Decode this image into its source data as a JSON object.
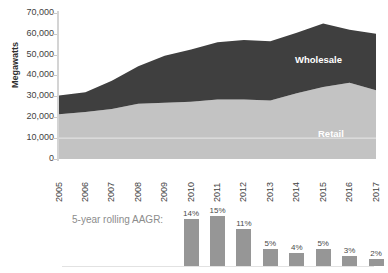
{
  "chart_data": {
    "type": "area",
    "title": "",
    "xlabel": "",
    "ylabel": "Megawatts",
    "ylim": [
      0,
      70000
    ],
    "ytick_labels": [
      "70,000",
      "60,000",
      "50,000",
      "40,000",
      "30,000",
      "20,000",
      "10,000",
      "0"
    ],
    "ytick_values": [
      70000,
      60000,
      50000,
      40000,
      30000,
      20000,
      10000,
      0
    ],
    "grid": false,
    "legend_position": "inline-annotation",
    "stacked": true,
    "categories": [
      "2005",
      "2006",
      "2007",
      "2008",
      "2009",
      "2010",
      "2011",
      "2012",
      "2013",
      "2014",
      "2015",
      "2016",
      "2017"
    ],
    "series": [
      {
        "name": "Retail",
        "color": "#c3c3c3",
        "values": [
          21500,
          22500,
          24000,
          26500,
          27000,
          27500,
          28500,
          28500,
          28000,
          31500,
          34500,
          36500,
          33000
        ]
      },
      {
        "name": "Wholesale",
        "color": "#3f3f3f",
        "values": [
          9000,
          9500,
          13500,
          18000,
          22500,
          25000,
          27500,
          28500,
          28500,
          29000,
          30500,
          25500,
          27000
        ]
      }
    ],
    "totals": [
      30500,
      32000,
      37500,
      44500,
      49500,
      52500,
      56000,
      57000,
      56500,
      60500,
      65000,
      62000,
      60000
    ],
    "annotations": [
      {
        "name": "Wholesale",
        "text": "Wholesale"
      },
      {
        "name": "Retail",
        "text": "Retail"
      }
    ]
  },
  "aagr": {
    "label": "5-year rolling AAGR:",
    "categories": [
      "2010",
      "2011",
      "2012",
      "2013",
      "2014",
      "2015",
      "2016",
      "2017"
    ],
    "values": [
      14,
      15,
      11,
      5,
      4,
      5,
      3,
      2
    ],
    "value_labels": [
      "14%",
      "15%",
      "11%",
      "5%",
      "4%",
      "5%",
      "3%",
      "2%"
    ],
    "bar_color": "#969696"
  },
  "colors": {
    "retail": "#c3c3c3",
    "wholesale": "#3f3f3f",
    "axis": "#d4d4d4",
    "text": "#3f3f3f",
    "muted_text": "#8c8c8c"
  }
}
